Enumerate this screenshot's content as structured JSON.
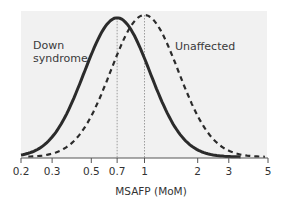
{
  "chart_data": {
    "type": "line",
    "title": "",
    "xlabel": "MSAFP (MoM)",
    "ylabel": "",
    "xscale": "log",
    "xlim": [
      0.2,
      5
    ],
    "ticks": [
      0.2,
      0.3,
      0.5,
      0.7,
      1,
      2,
      3,
      5
    ],
    "tick_labels": [
      "0.2",
      "0.3",
      "0.5",
      "0.7",
      "1",
      "2",
      "3",
      "5"
    ],
    "grid": false,
    "reference_lines": [
      0.7,
      1
    ],
    "series": [
      {
        "name": "Down syndrome",
        "style": "solid",
        "distribution": "log-normal",
        "median": 0.7,
        "log_sigma": 0.43,
        "relative_peak": 0.98,
        "x_range": [
          0.2,
          3.5
        ]
      },
      {
        "name": "Unaffected",
        "style": "dashed",
        "distribution": "log-normal",
        "median": 1.0,
        "log_sigma": 0.44,
        "relative_peak": 1.0,
        "x_range": [
          0.22,
          4.8
        ]
      }
    ],
    "annotations": [
      {
        "text": "Down\nsyndrome",
        "series": "Down syndrome"
      },
      {
        "text": "Unaffected",
        "series": "Unaffected"
      }
    ],
    "background": "#f1f1f1",
    "line_color": "#2b2b2b"
  },
  "labels": {
    "down_line1": "Down",
    "down_line2": "syndrome",
    "unaffected": "Unaffected",
    "xlabel": "MSAFP (MoM)"
  }
}
